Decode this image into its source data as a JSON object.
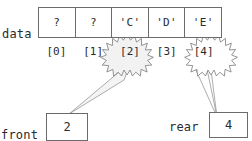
{
  "diagram": {
    "array_label": "data",
    "cells": [
      {
        "value": "?",
        "index": "[0]"
      },
      {
        "value": "?",
        "index": "[1]"
      },
      {
        "value": "'C'",
        "index": "[2]"
      },
      {
        "value": "'D'",
        "index": "[3]"
      },
      {
        "value": "'E'",
        "index": "[4]"
      }
    ],
    "pointers": [
      {
        "name": "front",
        "label": "front",
        "value": "2",
        "target_index": "[2]"
      },
      {
        "name": "rear",
        "label": "rear",
        "value": "4",
        "target_index": "[4]"
      }
    ],
    "highlights": [
      "[2]",
      "[4]"
    ],
    "colors": {
      "stroke": "#6b6b6b",
      "text": "#2b2b2b",
      "background": "#ffffff",
      "burst_fill": "#f2f2f2",
      "connector": "#8a8a8a"
    }
  }
}
